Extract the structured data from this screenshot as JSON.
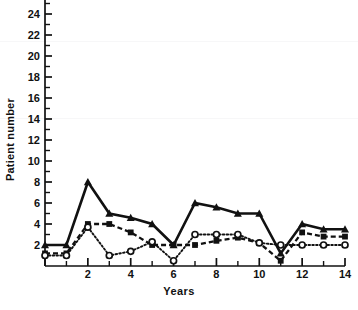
{
  "chart_data": {
    "type": "line",
    "title": "",
    "xlabel": "Years",
    "ylabel": "Patient number",
    "xlim": [
      0,
      14
    ],
    "ylim": [
      0,
      26
    ],
    "xticks": [
      0,
      2,
      4,
      6,
      8,
      10,
      12,
      14
    ],
    "xtick_labels": [
      "",
      "2",
      "4",
      "6",
      "8",
      "10",
      "12",
      "14"
    ],
    "yticks": [
      2,
      4,
      6,
      8,
      10,
      12,
      14,
      16,
      18,
      20,
      22,
      24,
      26
    ],
    "ytick_labels": [
      "2",
      "4",
      "6",
      "8",
      "10",
      "12",
      "14",
      "16",
      "18",
      "20",
      "22",
      "24",
      "26"
    ],
    "grid": false,
    "legend": "none",
    "x": [
      0,
      1,
      2,
      3,
      4,
      5,
      6,
      7,
      8,
      9,
      10,
      11,
      12,
      13,
      14
    ],
    "series": [
      {
        "name": "triangle-series",
        "marker": "filled-triangle",
        "line_style": "solid",
        "color": "#111111",
        "values": [
          2,
          2,
          8,
          5,
          4.6,
          4,
          2,
          6,
          5.6,
          5,
          5,
          1.2,
          4,
          3.5,
          3.5
        ]
      },
      {
        "name": "square-series",
        "marker": "filled-square",
        "line_style": "dashed",
        "color": "#111111",
        "values": [
          1.2,
          1.2,
          4,
          4,
          3.2,
          2,
          2,
          2,
          2.4,
          2.7,
          2.2,
          0.5,
          3.2,
          2.8,
          2.8
        ]
      },
      {
        "name": "circle-series",
        "marker": "open-circle",
        "line_style": "dotted",
        "color": "#111111",
        "values": [
          1,
          1,
          3.7,
          1,
          1.4,
          2.3,
          0.5,
          3,
          3,
          3,
          2.2,
          2,
          2,
          2,
          2
        ]
      }
    ]
  },
  "axes": {
    "y_axis_label": "Patient number",
    "x_axis_label": "Years"
  },
  "caption": ""
}
